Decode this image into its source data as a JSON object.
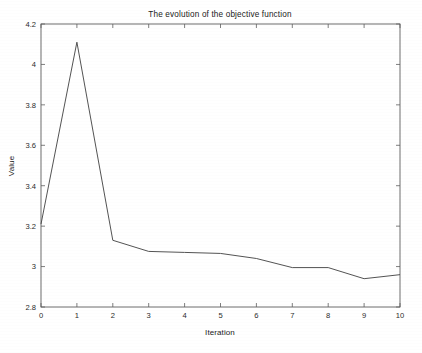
{
  "chart_data": {
    "type": "line",
    "title": "The evolution of the objective function",
    "xlabel": "Iteration",
    "ylabel": "Value",
    "x": [
      0,
      1,
      2,
      3,
      4,
      5,
      6,
      7,
      8,
      9,
      10
    ],
    "values": [
      3.21,
      4.11,
      3.13,
      3.075,
      3.07,
      3.065,
      3.04,
      2.995,
      2.995,
      2.94,
      2.96
    ],
    "series": [
      {
        "name": "objective",
        "values": [
          3.21,
          4.11,
          3.13,
          3.075,
          3.07,
          3.065,
          3.04,
          2.995,
          2.995,
          2.94,
          2.96
        ]
      }
    ],
    "xlim": [
      0,
      10
    ],
    "ylim": [
      2.8,
      4.2
    ],
    "xticks": [
      0,
      1,
      2,
      3,
      4,
      5,
      6,
      7,
      8,
      9,
      10
    ],
    "xticklabels": [
      "0",
      "1",
      "2",
      "3",
      "4",
      "5",
      "6",
      "7",
      "8",
      "9",
      "10"
    ],
    "yticks": [
      2.8,
      3.0,
      3.2,
      3.4,
      3.6,
      3.8,
      4.0,
      4.2
    ],
    "yticklabels": [
      "2.8",
      "3",
      "3.2",
      "3.4",
      "3.6",
      "3.8",
      "4",
      "4.2"
    ],
    "grid": false,
    "legend": null,
    "legend_position": "none",
    "line_color": "#4a4a4a",
    "axis_color": "#5e5e5e",
    "background_color": "#ffffff"
  }
}
